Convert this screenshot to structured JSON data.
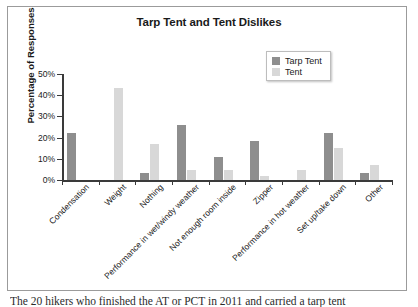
{
  "chart_data": {
    "type": "bar",
    "title": "Tarp Tent and Tent Dislikes",
    "xlabel": "",
    "ylabel": "Percentage of Responses",
    "ylim": [
      0,
      50
    ],
    "ytick_labels": [
      "0%",
      "10%",
      "20%",
      "30%",
      "40%",
      "50%"
    ],
    "ytick_values": [
      0,
      10,
      20,
      30,
      40,
      50
    ],
    "grid": false,
    "legend_position": "top-right",
    "categories": [
      "Condensation",
      "Weight",
      "Nothing",
      "Performance in wet/windy weather",
      "Not enough room inside",
      "Zipper",
      "Performance in hot weather",
      "Set up/take down",
      "Other"
    ],
    "series": [
      {
        "name": "Tarp Tent",
        "color": "#8e8e8e",
        "values": [
          22,
          0,
          3.5,
          26,
          11,
          18.5,
          0,
          22,
          3.5
        ]
      },
      {
        "name": "Tent",
        "color": "#d8d8d8",
        "values": [
          0,
          43.5,
          17,
          4.5,
          4.5,
          2,
          4.5,
          15,
          7
        ]
      }
    ]
  },
  "caption": {
    "text": "The 20 hikers who finished the AT or PCT in 2011 and carried a tarp tent"
  }
}
